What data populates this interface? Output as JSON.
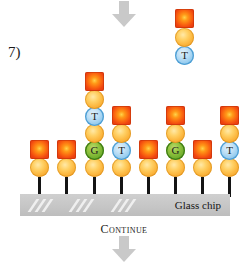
{
  "figure": {
    "step_label": "7)",
    "top_caption": "bases are incorporated and detected",
    "chip_label": "Glass chip",
    "continue_label": "Continue"
  },
  "colors": {
    "fluorophore": "#f05a14",
    "sugar": "#fcb73f",
    "base_t": "#93cbef",
    "base_g": "#6fae2c",
    "stem": "#141414",
    "chip": "#c6c6c6",
    "arrow": "#c9c9c9"
  },
  "free_nucleotide": {
    "x": 175,
    "stack": [
      {
        "kind": "base",
        "letter": "T",
        "base": "t",
        "y": 46
      },
      {
        "kind": "sugar",
        "letter": "",
        "y": 28
      },
      {
        "kind": "fluor",
        "letter": "",
        "y": 9
      }
    ]
  },
  "arrows": [
    {
      "name": "top-arrow",
      "x": 112,
      "y": 1
    },
    {
      "name": "bottom-arrow",
      "x": 112,
      "y": 236
    }
  ],
  "chip": {
    "shines": [
      {
        "x": 12,
        "y": 5
      },
      {
        "x": 19,
        "y": 5
      },
      {
        "x": 26,
        "y": 5
      },
      {
        "x": 53,
        "y": 5
      },
      {
        "x": 60,
        "y": 5
      },
      {
        "x": 67,
        "y": 5
      },
      {
        "x": 95,
        "y": 5
      },
      {
        "x": 102,
        "y": 5
      },
      {
        "x": 109,
        "y": 5
      }
    ]
  },
  "strands": [
    {
      "id": 1,
      "x": 30,
      "stem": {
        "y": 177,
        "height": 20
      },
      "stack": [
        {
          "kind": "sugar",
          "letter": "",
          "y": 158
        },
        {
          "kind": "fluor",
          "letter": "",
          "y": 140
        }
      ]
    },
    {
      "id": 2,
      "x": 57,
      "stem": {
        "y": 177,
        "height": 20
      },
      "stack": [
        {
          "kind": "sugar",
          "letter": "",
          "y": 158
        },
        {
          "kind": "fluor",
          "letter": "",
          "y": 140
        }
      ]
    },
    {
      "id": 3,
      "x": 85,
      "stem": {
        "y": 177,
        "height": 20
      },
      "stack": [
        {
          "kind": "sugar",
          "letter": "",
          "y": 158
        },
        {
          "kind": "base",
          "letter": "G",
          "base": "g",
          "y": 141
        },
        {
          "kind": "sugar",
          "letter": "",
          "y": 124
        },
        {
          "kind": "base",
          "letter": "T",
          "base": "t",
          "y": 107
        },
        {
          "kind": "sugar",
          "letter": "",
          "y": 90
        },
        {
          "kind": "fluor",
          "letter": "",
          "y": 72
        }
      ]
    },
    {
      "id": 4,
      "x": 112,
      "stem": {
        "y": 177,
        "height": 20
      },
      "stack": [
        {
          "kind": "sugar",
          "letter": "",
          "y": 158
        },
        {
          "kind": "base",
          "letter": "T",
          "base": "t",
          "y": 141
        },
        {
          "kind": "sugar",
          "letter": "",
          "y": 124
        },
        {
          "kind": "fluor",
          "letter": "",
          "y": 106
        }
      ]
    },
    {
      "id": 5,
      "x": 139,
      "stem": {
        "y": 177,
        "height": 20
      },
      "stack": [
        {
          "kind": "sugar",
          "letter": "",
          "y": 158
        },
        {
          "kind": "fluor",
          "letter": "",
          "y": 140
        }
      ]
    },
    {
      "id": 6,
      "x": 166,
      "stem": {
        "y": 177,
        "height": 20
      },
      "stack": [
        {
          "kind": "sugar",
          "letter": "",
          "y": 158
        },
        {
          "kind": "base",
          "letter": "G",
          "base": "g",
          "y": 141
        },
        {
          "kind": "sugar",
          "letter": "",
          "y": 124
        },
        {
          "kind": "fluor",
          "letter": "",
          "y": 106
        }
      ]
    },
    {
      "id": 7,
      "x": 193,
      "stem": {
        "y": 177,
        "height": 20
      },
      "stack": [
        {
          "kind": "sugar",
          "letter": "",
          "y": 158
        },
        {
          "kind": "fluor",
          "letter": "",
          "y": 140
        }
      ]
    },
    {
      "id": 8,
      "x": 220,
      "stem": {
        "y": 177,
        "height": 20
      },
      "stack": [
        {
          "kind": "sugar",
          "letter": "",
          "y": 158
        },
        {
          "kind": "base",
          "letter": "T",
          "base": "t",
          "y": 141
        },
        {
          "kind": "sugar",
          "letter": "",
          "y": 124
        },
        {
          "kind": "fluor",
          "letter": "",
          "y": 106
        }
      ]
    }
  ]
}
